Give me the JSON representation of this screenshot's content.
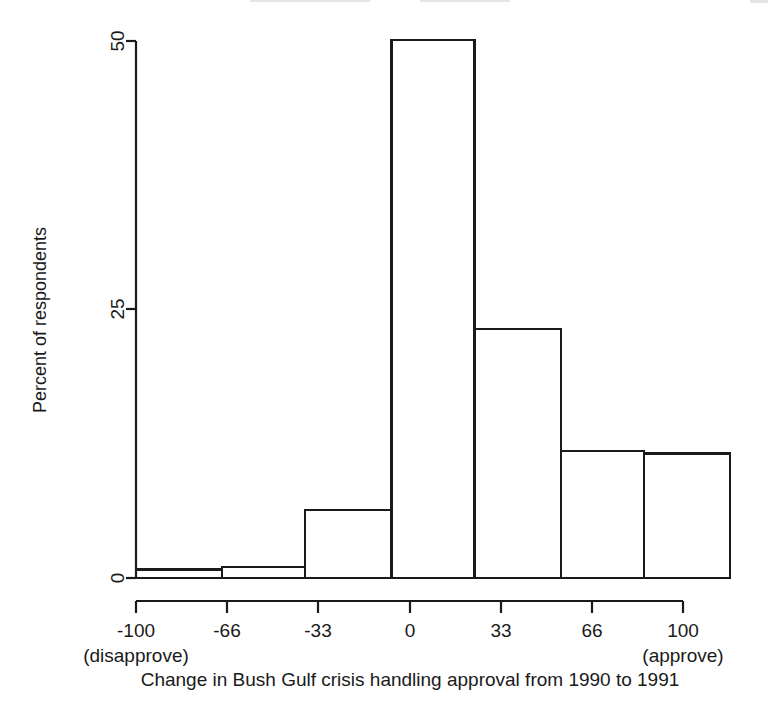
{
  "figure": {
    "background_color": "#ffffff",
    "ink_color": "#1a1a1a"
  },
  "chart_data": {
    "type": "bar",
    "title": "",
    "xlabel": "Change in Bush Gulf crisis handling approval from 1990 to 1991",
    "ylabel": "Percent of respondents",
    "categories": [
      "-100 to -71",
      "-71 to -43",
      "-43 to -14",
      "-14 to 14",
      "14 to 43",
      "43 to 71",
      "71 to 100"
    ],
    "values": [
      0.8,
      1.0,
      6.3,
      50.1,
      23.2,
      11.8,
      11.6
    ],
    "bin_edges": [
      -100,
      -71,
      -43,
      -14,
      14,
      43,
      71,
      100
    ],
    "xlim": [
      -115,
      100
    ],
    "ylim": [
      0,
      50
    ],
    "x_ticks": [
      -100,
      -66,
      -33,
      0,
      33,
      66,
      100
    ],
    "x_tick_labels": [
      "-100",
      "-66",
      "-33",
      "0",
      "33",
      "66",
      "100"
    ],
    "y_ticks": [
      0,
      25,
      50
    ],
    "y_tick_labels": [
      "0",
      "25",
      "50"
    ],
    "grid": false,
    "legend": false,
    "axis_left_anchor_label": "(disapprove)",
    "axis_right_anchor_label": "(approve)"
  },
  "axis": {
    "y_title": "Percent of respondents",
    "x_title": "Change in Bush Gulf crisis handling approval from 1990 to 1991",
    "y_tick_labels": [
      "50",
      "25",
      "0"
    ],
    "x_tick_labels": [
      "-100",
      "-66",
      "-33",
      "0",
      "33",
      "66",
      "100"
    ],
    "left_anchor": "(disapprove)",
    "right_anchor": "(approve)"
  }
}
